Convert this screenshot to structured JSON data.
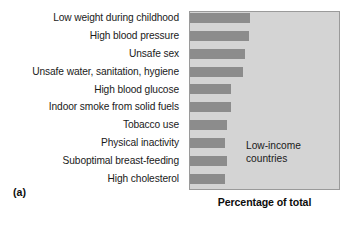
{
  "figure": {
    "panel_caption": "(a)",
    "annotation_line1": "Low-income",
    "annotation_line2": "countries",
    "axis_title": "Percentage of total",
    "bar_color": "#8c8c8c",
    "plot_background": "#d4d4d4",
    "plot_border": "#9a9a9a",
    "text_color": "#1a1a1a"
  },
  "chart_data": {
    "type": "bar",
    "orientation": "horizontal",
    "title": "",
    "subtitle": "",
    "xlabel": "Percentage of total",
    "ylabel": "",
    "grid": false,
    "legend": null,
    "xlim": [
      0,
      100
    ],
    "xtick_labels": [],
    "annotations": [
      "Low-income countries",
      "(a)"
    ],
    "categories": [
      "Low weight during childhood",
      "High blood pressure",
      "Unsafe sex",
      "Unsafe water, sanitation, hygiene",
      "High blood glucose",
      "Indoor smoke from solid fuels",
      "Tobacco use",
      "Physical inactivity",
      "Suboptimal breast-feeding",
      "High cholesterol"
    ],
    "values": [
      40.4,
      39.7,
      37.1,
      35.8,
      27.8,
      27.8,
      24.5,
      23.8,
      24.5,
      23.2
    ],
    "series": [
      {
        "name": "Low-income countries",
        "values": [
          40.4,
          39.7,
          37.1,
          35.8,
          27.8,
          27.8,
          24.5,
          23.8,
          24.5,
          23.2
        ]
      }
    ]
  }
}
